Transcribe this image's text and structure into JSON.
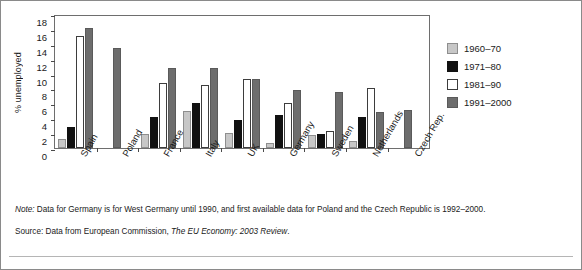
{
  "chart_data": {
    "type": "bar",
    "title": "",
    "xlabel": "",
    "ylabel": "% unemployed",
    "ylim": [
      0,
      18
    ],
    "ytick_step": 2,
    "yticks": [
      18,
      16,
      14,
      12,
      10,
      8,
      6,
      4,
      2,
      0
    ],
    "grid": false,
    "legend_position": "right",
    "categories": [
      "Spain",
      "Poland",
      "France",
      "Italy",
      "UK",
      "Germany",
      "Sweden",
      "Netherlands",
      "Czech Rep."
    ],
    "series": [
      {
        "name": "1960–70",
        "color": "#c7c7c7",
        "values": [
          1.2,
          0,
          1.9,
          5.0,
          2.0,
          0.7,
          1.8,
          0.9,
          0
        ]
      },
      {
        "name": "1971–80",
        "color": "#111111",
        "values": [
          2.8,
          0,
          4.1,
          6.1,
          3.8,
          4.5,
          1.9,
          4.2,
          0
        ]
      },
      {
        "name": "1981–90",
        "color": "#ffffff",
        "values": [
          15.1,
          0,
          8.8,
          8.5,
          9.3,
          6.1,
          2.3,
          8.1,
          0
        ]
      },
      {
        "name": "1991–2000",
        "color": "#6d6d6d",
        "values": [
          16.1,
          13.4,
          10.8,
          10.7,
          9.3,
          7.8,
          7.5,
          4.9,
          5.1
        ]
      }
    ]
  },
  "legend": {
    "items": [
      {
        "label": "1960–70"
      },
      {
        "label": "1971–80"
      },
      {
        "label": "1981–90"
      },
      {
        "label": "1991–2000"
      }
    ]
  },
  "notes": {
    "note_prefix": "Note:",
    "note_text": "Data for Germany is for West Germany until 1990,  and first available data for Poland and the Czech Republic is 1992–2000.",
    "source_prefix": "Source:",
    "source_text_a": "Data from European Commission, ",
    "source_text_b": "The EU Economy:  2003 Review",
    "source_text_c": "."
  }
}
